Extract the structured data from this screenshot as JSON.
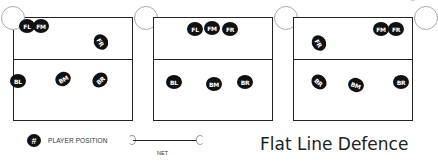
{
  "title": "Flat Line Defence",
  "corner_text": "S",
  "legend": {
    "player_symbol": "#",
    "player_label": "PLAYER POSITION",
    "net_label": "NET"
  },
  "courts": [
    {
      "name": "court-1",
      "players": [
        {
          "label": "FL",
          "x": 27,
          "y": 26,
          "rot": 0
        },
        {
          "label": "FM",
          "x": 41,
          "y": 26,
          "rot": 0
        },
        {
          "label": "FR",
          "x": 101,
          "y": 42,
          "rot": 60
        },
        {
          "label": "BL",
          "x": 18,
          "y": 81,
          "rot": 0
        },
        {
          "label": "BM",
          "x": 63,
          "y": 79,
          "rot": -30
        },
        {
          "label": "BR",
          "x": 100,
          "y": 80,
          "rot": -40
        }
      ]
    },
    {
      "name": "court-2",
      "players": [
        {
          "label": "FL",
          "x": 195,
          "y": 29,
          "rot": 0
        },
        {
          "label": "FM",
          "x": 212,
          "y": 28,
          "rot": 0
        },
        {
          "label": "FR",
          "x": 230,
          "y": 29,
          "rot": 0
        },
        {
          "label": "BL",
          "x": 174,
          "y": 82,
          "rot": 0
        },
        {
          "label": "BM",
          "x": 214,
          "y": 84,
          "rot": 0
        },
        {
          "label": "BR",
          "x": 245,
          "y": 82,
          "rot": 0
        }
      ]
    },
    {
      "name": "court-3",
      "players": [
        {
          "label": "FM",
          "x": 381,
          "y": 29,
          "rot": 0
        },
        {
          "label": "FR",
          "x": 396,
          "y": 29,
          "rot": 0
        },
        {
          "label": "FR",
          "x": 319,
          "y": 43,
          "rot": 60
        },
        {
          "label": "BR",
          "x": 319,
          "y": 82,
          "rot": 40
        },
        {
          "label": "BM",
          "x": 356,
          "y": 85,
          "rot": 20
        },
        {
          "label": "BR",
          "x": 401,
          "y": 82,
          "rot": 0
        }
      ]
    }
  ],
  "colors": {
    "player_fill": "#111111",
    "player_text": "#ffffff",
    "court_line": "#222222",
    "post": "#aaaaaa"
  }
}
